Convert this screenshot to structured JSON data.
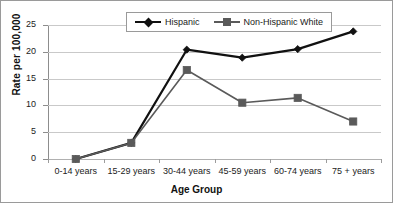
{
  "chart_data": {
    "type": "line",
    "title": "",
    "xlabel": "Age Group",
    "ylabel": "Rate per 100,000",
    "categories": [
      "0-14 years",
      "15-29 years",
      "30-44 years",
      "45-59 years",
      "60-74 years",
      "75 + years"
    ],
    "ylim": [
      0,
      25
    ],
    "yticks": [
      0,
      5,
      10,
      15,
      20,
      25
    ],
    "ytick_labels": [
      "0",
      "5",
      "10",
      "15",
      "20",
      "25"
    ],
    "grid": "horizontal",
    "legend_position": "top-center",
    "series": [
      {
        "name": "Hispanic",
        "values": [
          0,
          3.0,
          20.4,
          18.9,
          20.5,
          23.8
        ],
        "color": "#111111",
        "marker": "diamond"
      },
      {
        "name": "Non-Hispanic White",
        "values": [
          0,
          3.0,
          16.6,
          10.5,
          11.4,
          7.0
        ],
        "color": "#5a5a5a",
        "marker": "square"
      }
    ]
  },
  "legend": {
    "entries": [
      {
        "label": "Hispanic",
        "marker_name": "diamond-marker"
      },
      {
        "label": "Non-Hispanic White",
        "marker_name": "square-marker"
      }
    ]
  },
  "colors": {
    "hispanic": "#111111",
    "non_hispanic_white": "#5a5a5a",
    "gridline": "#c9c9c9",
    "axis": "#8d8d8d",
    "border": "#9a9a9a",
    "background": "#ffffff"
  }
}
